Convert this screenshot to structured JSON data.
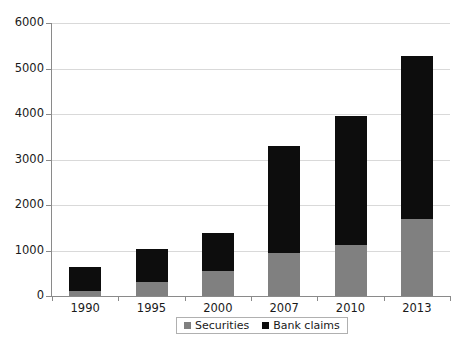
{
  "chart_data": {
    "type": "bar",
    "subtype": "stacked-bar",
    "title": "",
    "xlabel": "",
    "ylabel": "",
    "categories": [
      "1990",
      "1995",
      "2000",
      "2007",
      "2010",
      "2013"
    ],
    "series": [
      {
        "name": "Securities",
        "color": "#808080",
        "values": [
          110,
          300,
          560,
          950,
          1120,
          1700
        ]
      },
      {
        "name": "Bank claims",
        "color": "#0d0d0d",
        "values": [
          520,
          740,
          820,
          2350,
          2830,
          3580
        ]
      }
    ],
    "totals": [
      630,
      1040,
      1380,
      3300,
      3950,
      5280
    ],
    "ylim": [
      0,
      6000
    ],
    "yticks": [
      0,
      1000,
      2000,
      3000,
      4000,
      5000,
      6000
    ],
    "ytick_labels": [
      "0",
      "1000",
      "2000",
      "3000",
      "4000",
      "5000",
      "6000"
    ],
    "grid": true,
    "grid_axis": "y",
    "legend_position": "bottom-center",
    "legend_entries": [
      "Securities",
      "Bank claims"
    ],
    "background": "#ffffff",
    "gridline_color": "#d9d9d9",
    "axis_color": "#8a8a8a"
  },
  "legend": {
    "securities_label": "Securities",
    "bank_claims_label": "Bank claims"
  },
  "caption": {
    "text": ""
  }
}
